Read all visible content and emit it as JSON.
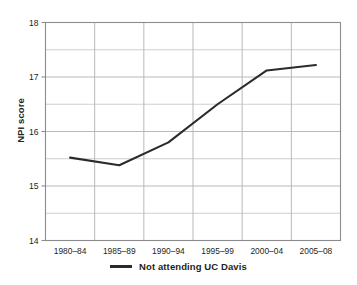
{
  "chart_data": {
    "type": "line",
    "title": "",
    "xlabel": "",
    "ylabel": "NPI score",
    "categories": [
      "1980–84",
      "1985–89",
      "1990–94",
      "1995–99",
      "2000–04",
      "2005–08"
    ],
    "series": [
      {
        "name": "Not attending UC Davis",
        "values": [
          15.52,
          15.38,
          15.8,
          16.5,
          17.12,
          17.22
        ],
        "color": "#2b2b2b",
        "marker": "circle"
      }
    ],
    "ylim": [
      14,
      18
    ],
    "yticks": [
      14,
      15,
      16,
      17,
      18
    ],
    "ytick_labels": [
      "14",
      "15",
      "16",
      "17",
      "18"
    ],
    "y_minor_ticks": [
      14.5,
      15.5,
      16.5,
      17.5
    ],
    "grid": true,
    "grid_color": "#b9b9b9",
    "minor_grid_color": "#cfcfcf",
    "background": "#ffffff",
    "legend_position": "bottom"
  },
  "legend": {
    "entries": [
      {
        "label": "Not attending UC Davis",
        "color": "#2b2b2b"
      }
    ]
  },
  "axes": {
    "y_title": "NPI score"
  }
}
